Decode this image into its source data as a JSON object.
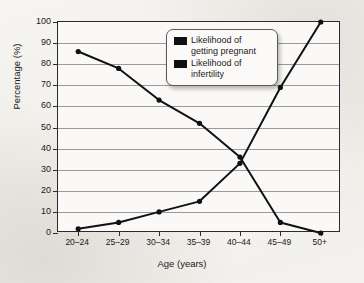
{
  "chart_data": {
    "type": "line",
    "title": "",
    "xlabel": "Age (years)",
    "ylabel": "Percentage (%)",
    "categories": [
      "20–24",
      "25–29",
      "30–34",
      "35–39",
      "40–44",
      "45–49",
      "50+"
    ],
    "ylim": [
      0,
      100
    ],
    "yticks": [
      0,
      10,
      20,
      30,
      40,
      50,
      60,
      70,
      80,
      90,
      100
    ],
    "ytick_labels": [
      "0",
      "10",
      "20",
      "30",
      "40",
      "50",
      "60",
      "70",
      "80",
      "90",
      "100"
    ],
    "grid": true,
    "legend_position": "top-center",
    "series": [
      {
        "name": "Likelihood of getting pregnant",
        "color": "#111111",
        "marker": "circle",
        "values": [
          86,
          78,
          63,
          52,
          36,
          5,
          0
        ]
      },
      {
        "name": "Likelihood of infertility",
        "color": "#111111",
        "marker": "circle",
        "values": [
          2,
          5,
          10,
          15,
          33,
          69,
          100
        ]
      }
    ]
  },
  "legend": {
    "items": [
      {
        "label_line1": "Likelihood of",
        "label_line2": "getting pregnant",
        "swatch_color": "#111111"
      },
      {
        "label_line1": "Likelihood of",
        "label_line2": "infertility",
        "swatch_color": "#111111"
      }
    ]
  },
  "colors": {
    "page_background": "#f3f1ee",
    "plot_background": "#faf9f7",
    "axis": "#2b2b2b",
    "gridline": "#9a9a9a",
    "text": "#1a1a1a"
  }
}
